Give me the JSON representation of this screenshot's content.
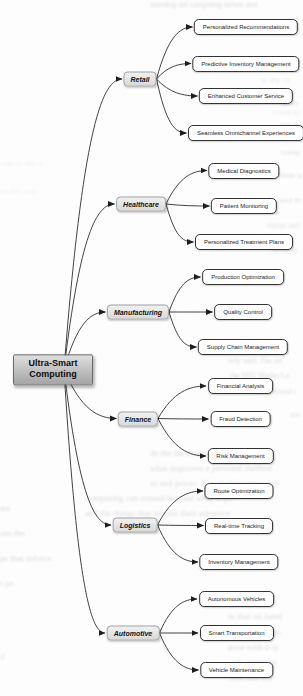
{
  "diagram": {
    "root": {
      "label": "Ultra-Smart Computing"
    },
    "branches": [
      {
        "label": "Retail",
        "children": [
          "Personalized Recommendations",
          "Predictive Inventory Management",
          "Enhanced Customer Service",
          "Seamless Omnichannel Experiences"
        ]
      },
      {
        "label": "Healthcare",
        "children": [
          "Medical Diagnostics",
          "Patient Monitoring",
          "Personalized Treatment Plans"
        ]
      },
      {
        "label": "Manufacturing",
        "children": [
          "Production Optimization",
          "Quality Control",
          "Supply Chain Management"
        ]
      },
      {
        "label": "Finance",
        "children": [
          "Financial Analysis",
          "Fraud Detection",
          "Risk Management"
        ]
      },
      {
        "label": "Logistics",
        "children": [
          "Route Optimization",
          "Real-time Tracking",
          "Inventory Management"
        ]
      },
      {
        "label": "Automotive",
        "children": [
          "Autonomous Vehicles",
          "Smart Transportation",
          "Vehicle Maintenance"
        ]
      }
    ],
    "colors": {
      "edge": "#2e2e2e",
      "arrow": "#1e1e1e",
      "leaf_bg": "#ffffff",
      "leaf_border": "#333333",
      "branch_bg": "#e4e4e4",
      "branch_border": "#9e9e9e",
      "root_bg_top": "#dedede",
      "root_bg_bottom": "#a4a4a4",
      "root_border": "#6a6a6a"
    }
  },
  "background": {
    "note": "illegible ghosted text bleed-through from page behind diagram",
    "ghost_fragments": [
      "standing set computing before and",
      "the s",
      "in the m",
      "ation",
      "nal mo",
      "count fo",
      "comp",
      "their s",
      "and th",
      "vision set",
      "tems w",
      "rate in the s",
      "nt the com",
      "orly said. The int",
      "the MIT Media La",
      "of MIT found t",
      "ow",
      "de the hardware into which",
      "what improves a personal method",
      "as and prices. Key performance met",
      "computing can extend beyond what is po",
      "and the things that inform their adoption",
      "ms",
      "om the",
      "ps that inforce",
      "s pr",
      "in that on hand",
      "for the advanc",
      "pose with a sy",
      "ed computin",
      "tion and mo",
      "d"
    ]
  }
}
